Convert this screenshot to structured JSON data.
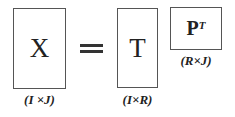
{
  "equation": {
    "lhs": {
      "symbol": "X",
      "dims": "(I ×J)"
    },
    "operator": "=",
    "rhs": [
      {
        "symbol": "T",
        "dims": "(I×R)"
      },
      {
        "symbol": "P",
        "superscript": "T",
        "dims": "(R×J)"
      }
    ]
  }
}
